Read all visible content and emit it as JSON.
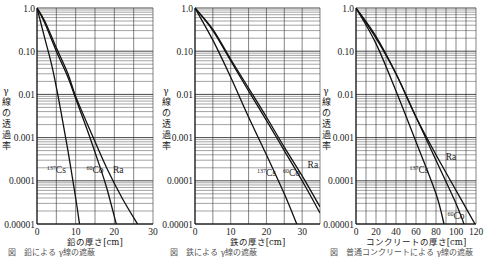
{
  "chart_data": [
    {
      "type": "line",
      "title": "",
      "xlabel": "鉛の厚さ[cm]",
      "ylabel": "γ線の透過率",
      "yscale": "log",
      "xlim": [
        0,
        30
      ],
      "ylim": [
        1e-05,
        1.0
      ],
      "x_ticks": [
        "0",
        "10",
        "20",
        "30"
      ],
      "y_ticks": [
        "1.0",
        "0.10",
        "0.01",
        "0.001",
        "0.0001",
        "0.00001"
      ],
      "grid": true,
      "series": [
        {
          "name": "137Cs",
          "x": [
            0,
            2,
            4,
            6,
            8,
            10,
            11
          ],
          "y": [
            1.0,
            0.2,
            0.04,
            0.005,
            0.0005,
            4e-05,
            1e-05
          ]
        },
        {
          "name": "60Co",
          "x": [
            0,
            2,
            5,
            8,
            10,
            13,
            16,
            18,
            20.5
          ],
          "y": [
            1.0,
            0.45,
            0.1,
            0.025,
            0.008,
            0.0015,
            0.00025,
            7e-05,
            1e-05
          ]
        },
        {
          "name": "Ra",
          "x": [
            0,
            2,
            5,
            8,
            10,
            14,
            18,
            22,
            26
          ],
          "y": [
            1.0,
            0.5,
            0.12,
            0.03,
            0.009,
            0.0013,
            0.0002,
            4e-05,
            1e-05
          ]
        }
      ],
      "annotations": [
        {
          "text": "137Cs",
          "x": 5,
          "y": 0.00015
        },
        {
          "text": "60Co",
          "x": 15,
          "y": 0.00015
        },
        {
          "text": "Ra",
          "x": 21,
          "y": 0.00015
        }
      ]
    },
    {
      "type": "line",
      "title": "",
      "xlabel": "鉄の厚さ[cm]",
      "ylabel": "γ線の透過率",
      "yscale": "log",
      "xlim": [
        0,
        35
      ],
      "ylim": [
        1e-05,
        1.0
      ],
      "x_ticks": [
        "0",
        "10",
        "20",
        "30"
      ],
      "y_ticks": [
        "1.0",
        "0.10",
        "0.01",
        "0.001",
        "0.0001",
        "0.00001"
      ],
      "grid": true,
      "series": [
        {
          "name": "137Cs",
          "x": [
            0,
            5,
            10,
            15,
            20,
            25,
            28.5
          ],
          "y": [
            1.0,
            0.18,
            0.025,
            0.003,
            0.0004,
            5e-05,
            1e-05
          ]
        },
        {
          "name": "60Co",
          "x": [
            0,
            5,
            10,
            15,
            20,
            25,
            30,
            35
          ],
          "y": [
            1.0,
            0.3,
            0.06,
            0.012,
            0.0025,
            0.0005,
            0.0001,
            1.8e-05
          ]
        },
        {
          "name": "Ra",
          "x": [
            0,
            5,
            10,
            15,
            20,
            25,
            30,
            35
          ],
          "y": [
            1.0,
            0.32,
            0.065,
            0.014,
            0.003,
            0.0006,
            0.00013,
            2.5e-05
          ]
        }
      ],
      "annotations": [
        {
          "text": "137Cs",
          "x": 20,
          "y": 0.00013
        },
        {
          "text": "60Co",
          "x": 27,
          "y": 0.00013
        },
        {
          "text": "Ra",
          "x": 33,
          "y": 0.0002
        }
      ]
    },
    {
      "type": "line",
      "title": "",
      "xlabel": "コンクリートの厚さ[cm]",
      "ylabel": "γ線の透過率",
      "yscale": "log",
      "xlim": [
        0,
        120
      ],
      "ylim": [
        1e-05,
        1.0
      ],
      "x_ticks": [
        "0",
        "20",
        "40",
        "60",
        "80",
        "100",
        "120"
      ],
      "y_ticks": [
        "1.0",
        "0.10",
        "0.01",
        "0.001",
        "0.0001",
        "0.00001"
      ],
      "grid": true,
      "series": [
        {
          "name": "137Cs",
          "x": [
            0,
            20,
            40,
            60,
            80,
            88
          ],
          "y": [
            1.0,
            0.15,
            0.012,
            0.0008,
            5e-05,
            1e-05
          ]
        },
        {
          "name": "60Co",
          "x": [
            0,
            20,
            40,
            60,
            80,
            100,
            108
          ],
          "y": [
            1.0,
            0.2,
            0.03,
            0.003,
            0.0003,
            3e-05,
            1e-05
          ]
        },
        {
          "name": "Ra",
          "x": [
            0,
            20,
            40,
            60,
            80,
            100,
            119
          ],
          "y": [
            1.0,
            0.22,
            0.03,
            0.003,
            0.0004,
            6e-05,
            1e-05
          ]
        }
      ],
      "annotations": [
        {
          "text": "137Cs",
          "x": 63,
          "y": 0.00015
        },
        {
          "text": "60Co",
          "x": 100,
          "y": 1.3e-05
        },
        {
          "text": "Ra",
          "x": 95,
          "y": 0.0003
        }
      ]
    }
  ],
  "labels": {
    "ylabel_chars": [
      "γ",
      "線",
      "の",
      "透",
      "過",
      "率"
    ],
    "charts": [
      {
        "xlabel": "鉛の厚さ[cm]",
        "caption": "図　鉛による γ線の遮蔽"
      },
      {
        "xlabel": "鉄の厚さ[cm]",
        "caption": "図　鉄による γ線の遮蔽"
      },
      {
        "xlabel": "コンクリートの厚さ[cm]",
        "caption": "図　普通コンクリートによる γ線の遮蔽"
      }
    ]
  }
}
